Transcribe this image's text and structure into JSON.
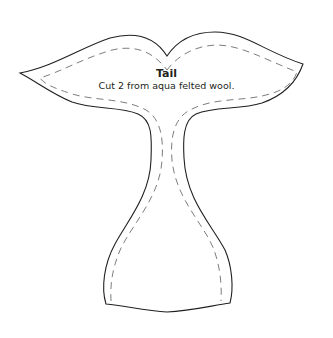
{
  "pattern": {
    "title": "Tail",
    "instruction": "Cut 2 from aqua felted wool.",
    "colors": {
      "background": "#ffffff",
      "cut_line": "#231f20",
      "stitch_line": "#6d6e71",
      "text": "#231f20"
    },
    "lines": {
      "cut_line": "solid outline",
      "stitch_line": "dashed seam allowance"
    }
  }
}
